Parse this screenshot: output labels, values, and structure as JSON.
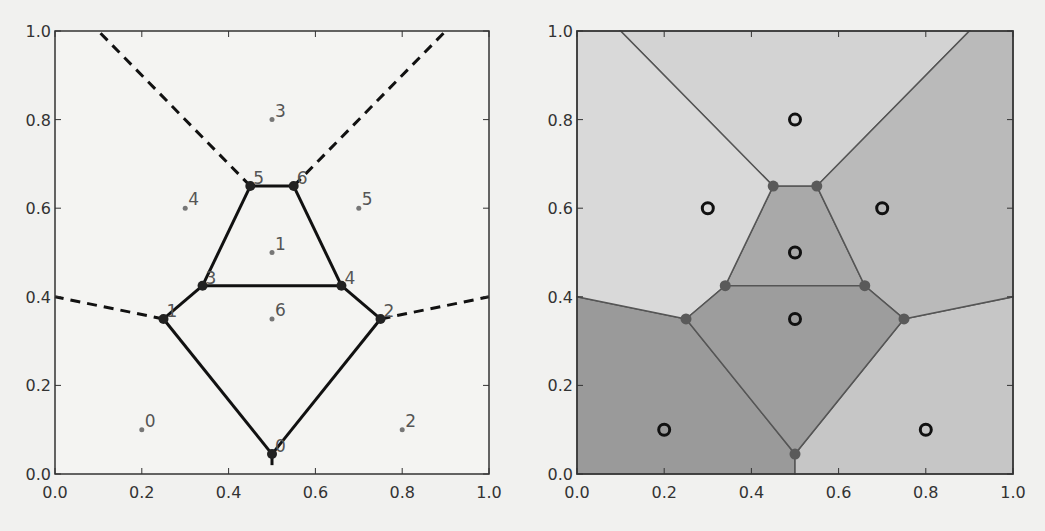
{
  "chart_data": [
    {
      "type": "scatter",
      "title": "",
      "subtitle": "Voronoi diagram: points, vertices and ridges",
      "xlabel": "",
      "ylabel": "",
      "xlim": [
        0.0,
        1.0
      ],
      "ylim": [
        0.0,
        1.0
      ],
      "grid": false,
      "legend": null,
      "x_ticks": [
        "0.0",
        "0.2",
        "0.4",
        "0.6",
        "0.8",
        "1.0"
      ],
      "y_ticks": [
        "0.0",
        "0.2",
        "0.4",
        "0.6",
        "0.8",
        "1.0"
      ],
      "points": [
        {
          "label": "0",
          "x": 0.2,
          "y": 0.1
        },
        {
          "label": "1",
          "x": 0.5,
          "y": 0.5
        },
        {
          "label": "2",
          "x": 0.8,
          "y": 0.1
        },
        {
          "label": "3",
          "x": 0.5,
          "y": 0.8
        },
        {
          "label": "4",
          "x": 0.3,
          "y": 0.6
        },
        {
          "label": "5",
          "x": 0.7,
          "y": 0.6
        },
        {
          "label": "6",
          "x": 0.5,
          "y": 0.35
        }
      ],
      "vertices": [
        {
          "label": "0",
          "x": 0.5,
          "y": 0.045
        },
        {
          "label": "1",
          "x": 0.25,
          "y": 0.35
        },
        {
          "label": "2",
          "x": 0.75,
          "y": 0.35
        },
        {
          "label": "3",
          "x": 0.34,
          "y": 0.425
        },
        {
          "label": "4",
          "x": 0.66,
          "y": 0.425
        },
        {
          "label": "5",
          "x": 0.45,
          "y": 0.65
        },
        {
          "label": "6",
          "x": 0.55,
          "y": 0.65
        }
      ],
      "finite_ridges": [
        [
          0,
          1
        ],
        [
          0,
          2
        ],
        [
          1,
          3
        ],
        [
          2,
          4
        ],
        [
          3,
          4
        ],
        [
          3,
          5
        ],
        [
          4,
          6
        ],
        [
          5,
          6
        ]
      ],
      "infinite_ridges": [
        {
          "from_vertex": 5,
          "to": [
            0.1,
            1.0
          ]
        },
        {
          "from_vertex": 6,
          "to": [
            0.9,
            1.0
          ]
        },
        {
          "from_vertex": 1,
          "to": [
            0.0,
            0.4
          ]
        },
        {
          "from_vertex": 2,
          "to": [
            1.0,
            0.4
          ]
        },
        {
          "from_vertex": 0,
          "to": [
            0.5,
            0.0
          ]
        }
      ]
    },
    {
      "type": "area",
      "title": "",
      "subtitle": "Voronoi regions filled",
      "xlabel": "",
      "ylabel": "",
      "xlim": [
        0.0,
        1.0
      ],
      "ylim": [
        0.0,
        1.0
      ],
      "grid": false,
      "legend": null,
      "x_ticks": [
        "0.0",
        "0.2",
        "0.4",
        "0.6",
        "0.8",
        "1.0"
      ],
      "y_ticks": [
        "0.0",
        "0.2",
        "0.4",
        "0.6",
        "0.8",
        "1.0"
      ],
      "regions": [
        {
          "point": 0,
          "fill": "#9a9a9a",
          "polygon": [
            [
              0,
              0
            ],
            [
              0.5,
              0
            ],
            [
              0.5,
              0.045
            ],
            [
              0.25,
              0.35
            ],
            [
              0,
              0.4
            ]
          ]
        },
        {
          "point": 1,
          "fill": "#a9a9a9",
          "polygon": [
            [
              0.34,
              0.425
            ],
            [
              0.66,
              0.425
            ],
            [
              0.55,
              0.65
            ],
            [
              0.45,
              0.65
            ]
          ]
        },
        {
          "point": 2,
          "fill": "#c6c6c6",
          "polygon": [
            [
              0.5,
              0
            ],
            [
              1,
              0
            ],
            [
              1,
              0.4
            ],
            [
              0.75,
              0.35
            ],
            [
              0.5,
              0.045
            ]
          ]
        },
        {
          "point": 3,
          "fill": "#d3d3d3",
          "polygon": [
            [
              0.1,
              1
            ],
            [
              0.9,
              1
            ],
            [
              0.55,
              0.65
            ],
            [
              0.45,
              0.65
            ]
          ]
        },
        {
          "point": 4,
          "fill": "#d9d9d9",
          "polygon": [
            [
              0,
              0.4
            ],
            [
              0.25,
              0.35
            ],
            [
              0.34,
              0.425
            ],
            [
              0.45,
              0.65
            ],
            [
              0.1,
              1
            ],
            [
              0,
              1
            ]
          ]
        },
        {
          "point": 5,
          "fill": "#bababa",
          "polygon": [
            [
              0.9,
              1
            ],
            [
              1,
              1
            ],
            [
              1,
              0.4
            ],
            [
              0.75,
              0.35
            ],
            [
              0.66,
              0.425
            ],
            [
              0.55,
              0.65
            ]
          ]
        },
        {
          "point": 6,
          "fill": "#9d9d9d",
          "polygon": [
            [
              0.25,
              0.35
            ],
            [
              0.34,
              0.425
            ],
            [
              0.66,
              0.425
            ],
            [
              0.75,
              0.35
            ],
            [
              0.5,
              0.045
            ]
          ]
        }
      ]
    }
  ],
  "plots": {
    "left": {
      "x_ticks": [
        "0.0",
        "0.2",
        "0.4",
        "0.6",
        "0.8",
        "1.0"
      ],
      "y_ticks": [
        "0.0",
        "0.2",
        "0.4",
        "0.6",
        "0.8",
        "1.0"
      ]
    },
    "right": {
      "x_ticks": [
        "0.0",
        "0.2",
        "0.4",
        "0.6",
        "0.8",
        "1.0"
      ],
      "y_ticks": [
        "0.0",
        "0.2",
        "0.4",
        "0.6",
        "0.8",
        "1.0"
      ]
    }
  },
  "colors": {
    "background": "#f1f1ef",
    "axis": "#333333",
    "ridge_left": "#111111",
    "ridge_right": "#555555",
    "point_left": "#777777",
    "label_left": "#555555",
    "vertex_right": "#5a5a5a",
    "point_ring": "#111111"
  }
}
